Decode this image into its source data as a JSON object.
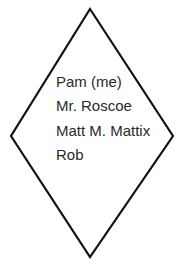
{
  "diagram": {
    "shape": "diamond",
    "stroke_color": "#111111",
    "fill_color": "#ffffff",
    "items": [
      {
        "label": "Pam (me)"
      },
      {
        "label": "Mr. Roscoe"
      },
      {
        "label": "Matt M. Mattix"
      },
      {
        "label": "Rob"
      }
    ]
  }
}
